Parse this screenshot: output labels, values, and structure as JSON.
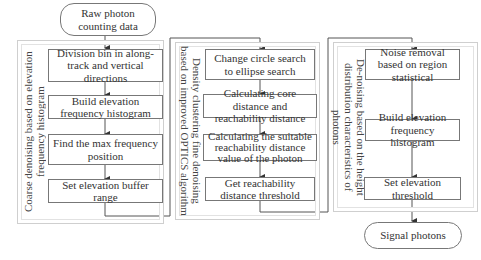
{
  "start": {
    "label": "Raw photon counting data"
  },
  "end": {
    "label": "Signal photons"
  },
  "groups": [
    {
      "label": "Coarse denoising based on elevation frequency histogram",
      "steps": [
        "Division bin in along-track and vertical directions",
        "Build elevation frequency histogram",
        "Find the max frequency position",
        "Set elevation buffer range"
      ]
    },
    {
      "label": "Density clustering fine denoising based on improved OPTICS algorithm",
      "steps": [
        "Change circle search to ellipse search",
        "Calculating core distance and reachability distance",
        "Calculating the suitable reachability distance value of the photon",
        "Get reachability distance threshold"
      ]
    },
    {
      "label": "De-noising based on the height distribution characteristics of photons",
      "steps": [
        "Noise removal based on region statistical",
        "Build elevation frequency histogram",
        "Set elevation threshold"
      ]
    }
  ],
  "colors": {
    "line": "#555555",
    "box_border": "#777777",
    "group_border": "#cfcfcf"
  }
}
